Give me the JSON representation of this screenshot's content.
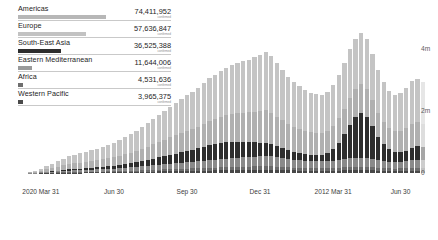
{
  "legend": {
    "rows": [
      {
        "name": "Americas",
        "value": "74,411,952",
        "sub": "confirmed",
        "color": "#b7b7b7",
        "bar_pct": 100.0
      },
      {
        "name": "Europe",
        "value": "57,636,847",
        "sub": "confirmed",
        "color": "#c2c2c2",
        "bar_pct": 77.5
      },
      {
        "name": "South-East Asia",
        "value": "36,525,388",
        "sub": "confirmed",
        "color": "#2d2d2d",
        "bar_pct": 49.1
      },
      {
        "name": "Eastern Mediterranean",
        "value": "11,644,006",
        "sub": "confirmed",
        "color": "#9a9a9a",
        "bar_pct": 15.6
      },
      {
        "name": "Africa",
        "value": "4,531,636",
        "sub": "confirmed",
        "color": "#6e6e6e",
        "bar_pct": 6.1
      },
      {
        "name": "Western Pacific",
        "value": "3,965,375",
        "sub": "confirmed",
        "color": "#4a4a4a",
        "bar_pct": 5.3
      }
    ]
  },
  "chart_data": {
    "type": "bar",
    "stacked": true,
    "title": "",
    "xlabel": "",
    "ylabel": "",
    "ylim": [
      0,
      6000000
    ],
    "ytick_labels": [
      "6m",
      "4m",
      "2m",
      "0"
    ],
    "ytick_values": [
      6000000,
      4000000,
      2000000,
      0
    ],
    "grid": false,
    "legend_position": "top-left",
    "xtick_labels": [
      "2020 Mar 31",
      "Jun 30",
      "Sep 30",
      "Dec 31",
      "2012 Mar 31",
      "Jun 30"
    ],
    "xtick_indices": [
      2,
      15,
      28,
      41,
      54,
      66
    ],
    "series": [
      {
        "name": "Americas",
        "color": "#c4c4c4",
        "values": [
          20000,
          35000,
          60000,
          100000,
          140000,
          180000,
          220000,
          250000,
          280000,
          300000,
          330000,
          350000,
          370000,
          400000,
          430000,
          470000,
          520000,
          560000,
          600000,
          650000,
          700000,
          760000,
          820000,
          880000,
          930000,
          980000,
          1030000,
          1090000,
          1150000,
          1180000,
          1230000,
          1300000,
          1380000,
          1430000,
          1480000,
          1520000,
          1580000,
          1620000,
          1660000,
          1700000,
          1760000,
          1820000,
          1880000,
          1830000,
          1720000,
          1620000,
          1520000,
          1450000,
          1380000,
          1320000,
          1280000,
          1250000,
          1230000,
          1260000,
          1330000,
          1400000,
          1480000,
          1560000,
          1620000,
          1650000,
          1600000,
          1500000,
          1380000,
          1280000,
          1200000,
          1180000,
          1220000,
          1300000,
          1380000,
          1400000,
          1350000
        ]
      },
      {
        "name": "Europe",
        "color": "#b0b0b0",
        "values": [
          15000,
          28000,
          45000,
          75000,
          100000,
          125000,
          150000,
          170000,
          185000,
          195000,
          205000,
          215000,
          225000,
          240000,
          255000,
          275000,
          300000,
          320000,
          345000,
          375000,
          400000,
          430000,
          465000,
          500000,
          530000,
          560000,
          590000,
          620000,
          650000,
          670000,
          700000,
          740000,
          780000,
          810000,
          840000,
          870000,
          900000,
          920000,
          940000,
          960000,
          990000,
          1020000,
          1050000,
          1020000,
          960000,
          900000,
          850000,
          810000,
          770000,
          740000,
          720000,
          700000,
          690000,
          705000,
          740000,
          785000,
          830000,
          875000,
          910000,
          925000,
          900000,
          840000,
          775000,
          720000,
          675000,
          660000,
          685000,
          730000,
          775000,
          785000,
          760000
        ]
      },
      {
        "name": "South-East Asia",
        "color": "#2e2e2e",
        "values": [
          2000,
          4000,
          7000,
          11000,
          16000,
          22000,
          28000,
          34000,
          40000,
          46000,
          52000,
          58000,
          64000,
          72000,
          80000,
          90000,
          102000,
          115000,
          130000,
          145000,
          165000,
          185000,
          210000,
          235000,
          260000,
          285000,
          310000,
          340000,
          370000,
          395000,
          420000,
          450000,
          480000,
          500000,
          520000,
          530000,
          530000,
          520000,
          505000,
          485000,
          465000,
          440000,
          415000,
          385000,
          350000,
          315000,
          280000,
          255000,
          235000,
          220000,
          210000,
          205000,
          215000,
          265000,
          380000,
          560000,
          800000,
          1080000,
          1320000,
          1450000,
          1330000,
          1050000,
          760000,
          540000,
          400000,
          330000,
          310000,
          330000,
          390000,
          440000,
          420000
        ]
      },
      {
        "name": "Eastern Mediterranean",
        "color": "#8a8a8a",
        "values": [
          5000,
          9000,
          14000,
          22000,
          30000,
          38000,
          46000,
          52000,
          58000,
          62000,
          66000,
          70000,
          74000,
          79000,
          84000,
          90000,
          98000,
          105000,
          113000,
          122000,
          131000,
          141000,
          152000,
          163000,
          172000,
          181000,
          190000,
          200000,
          210000,
          217000,
          226000,
          238000,
          250000,
          259000,
          268000,
          276000,
          285000,
          291000,
          297000,
          303000,
          311000,
          320000,
          329000,
          321000,
          303000,
          285000,
          269000,
          257000,
          245000,
          236000,
          230000,
          225000,
          222000,
          227000,
          238000,
          251000,
          265000,
          279000,
          290000,
          295000,
          287000,
          268000,
          247000,
          230000,
          216000,
          211000,
          219000,
          233000,
          247000,
          251000,
          243000
        ]
      },
      {
        "name": "Africa",
        "color": "#6b6b6b",
        "values": [
          1000,
          2000,
          3500,
          6000,
          8500,
          11000,
          13500,
          15500,
          17500,
          19000,
          20500,
          22000,
          23500,
          25500,
          27500,
          30000,
          33000,
          36000,
          39000,
          42500,
          46000,
          50000,
          54000,
          58000,
          61500,
          65000,
          68500,
          72000,
          76000,
          78500,
          82000,
          86500,
          91000,
          94500,
          98000,
          101000,
          104500,
          107000,
          109500,
          112000,
          115500,
          119000,
          122500,
          119500,
          112500,
          105500,
          99500,
          95000,
          90500,
          87000,
          84500,
          83000,
          82000,
          84000,
          88000,
          93000,
          98000,
          103000,
          107000,
          109000,
          106000,
          99000,
          91000,
          84500,
          79500,
          77500,
          80500,
          85500,
          90500,
          92000,
          89000
        ]
      },
      {
        "name": "Western Pacific",
        "color": "#484848",
        "values": [
          900,
          1700,
          3000,
          5200,
          7400,
          9500,
          11700,
          13500,
          15200,
          16500,
          17800,
          19000,
          20400,
          22100,
          23900,
          26000,
          28600,
          31200,
          33800,
          36800,
          39800,
          43300,
          46800,
          50200,
          53300,
          56300,
          59400,
          62400,
          65800,
          68000,
          71000,
          74900,
          78800,
          81900,
          84900,
          87500,
          90500,
          92700,
          94900,
          97000,
          100000,
          103000,
          106000,
          103500,
          97500,
          91400,
          86200,
          82300,
          78400,
          75400,
          73200,
          71900,
          71000,
          72800,
          76200,
          80600,
          84900,
          89200,
          92700,
          94400,
          91800,
          85700,
          78800,
          73200,
          68900,
          67100,
          69700,
          74100,
          78400,
          79700,
          77100
        ]
      }
    ],
    "partial_last_bars": 1
  }
}
